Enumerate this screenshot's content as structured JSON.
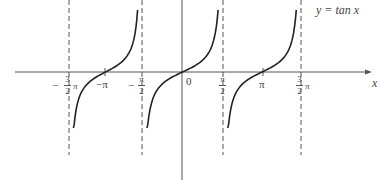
{
  "chart_data": {
    "type": "line",
    "title": "",
    "function": "y = tan x",
    "legend_label": "y = tan x",
    "xlabel": "x",
    "ylabel": "",
    "origin_label": "0",
    "x_tick_labels": [
      "-3/2 π",
      "-π",
      "-π/2",
      "0",
      "π/2",
      "π",
      "3/2 π"
    ],
    "x_ticks_radians": [
      -4.712,
      -3.1416,
      -1.5708,
      0,
      1.5708,
      3.1416,
      4.712
    ],
    "asymptotes": [
      "-3/2 π",
      "-π/2",
      "π/2",
      "3/2 π"
    ],
    "zeros": [
      "-π",
      "0",
      "π"
    ],
    "branches": [
      {
        "center": "-π",
        "x_range": [
          "-3/2 π",
          "-π/2"
        ]
      },
      {
        "center": "0",
        "x_range": [
          "-π/2",
          "π/2"
        ]
      },
      {
        "center": "π",
        "x_range": [
          "π/2",
          "3/2 π"
        ]
      }
    ],
    "grid": false,
    "asymptote_style": "dashed"
  },
  "labels": {
    "curve": "y = tan x",
    "x_axis": "x",
    "origin": "0",
    "neg_pi": "−π",
    "pi": "π",
    "minus": "−",
    "pi_sym": "π",
    "num3": "3",
    "den2": "2"
  }
}
